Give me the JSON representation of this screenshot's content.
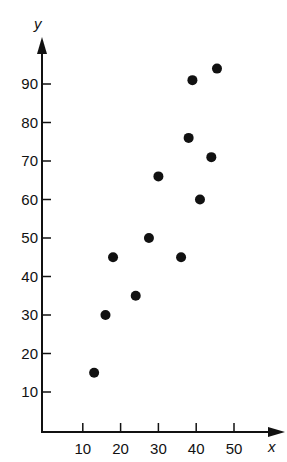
{
  "chart_data": {
    "type": "scatter",
    "title": "",
    "xlabel": "x",
    "ylabel": "y",
    "xlim": [
      0,
      55
    ],
    "ylim": [
      0,
      100
    ],
    "grid": false,
    "legend": null,
    "x_ticks": [
      10,
      20,
      30,
      40,
      50
    ],
    "y_ticks": [
      10,
      20,
      30,
      40,
      50,
      60,
      70,
      80,
      90
    ],
    "series": [
      {
        "name": "points",
        "color": "#111111",
        "points": [
          {
            "x": 13,
            "y": 15
          },
          {
            "x": 16,
            "y": 30
          },
          {
            "x": 18,
            "y": 45
          },
          {
            "x": 24,
            "y": 35
          },
          {
            "x": 27.5,
            "y": 50
          },
          {
            "x": 30,
            "y": 66
          },
          {
            "x": 36,
            "y": 45
          },
          {
            "x": 38,
            "y": 76
          },
          {
            "x": 39,
            "y": 91
          },
          {
            "x": 41,
            "y": 60
          },
          {
            "x": 44,
            "y": 71
          },
          {
            "x": 45.5,
            "y": 94
          }
        ]
      }
    ]
  },
  "axes": {
    "x_label": "x",
    "y_label": "y",
    "x_tick_labels": [
      "10",
      "20",
      "30",
      "40",
      "50"
    ],
    "y_tick_labels": [
      "10",
      "20",
      "30",
      "40",
      "50",
      "60",
      "70",
      "80",
      "90"
    ]
  },
  "colors": {
    "ink": "#111111",
    "background": "#ffffff"
  }
}
